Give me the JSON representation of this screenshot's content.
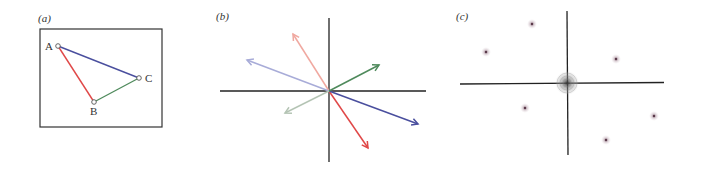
{
  "panels": {
    "a": {
      "label": "(a)",
      "box": {
        "x": 40,
        "y": 29,
        "w": 122,
        "h": 98
      },
      "nodes": [
        {
          "id": "A",
          "label": "A",
          "x": 58,
          "y": 46
        },
        {
          "id": "B",
          "label": "B",
          "x": 94,
          "y": 102
        },
        {
          "id": "C",
          "label": "C",
          "x": 139,
          "y": 78
        }
      ],
      "edges": [
        {
          "from": "A",
          "to": "B",
          "color": "#e04848"
        },
        {
          "from": "B",
          "to": "C",
          "color": "#4f8a5c"
        },
        {
          "from": "A",
          "to": "C",
          "color": "#4a4f9e"
        }
      ]
    },
    "b": {
      "label": "(b)",
      "origin": {
        "x": 329,
        "y": 91
      },
      "axes": {
        "x_from": 220,
        "x_to": 426,
        "y_from": 18,
        "y_to": 162
      },
      "vectors": [
        {
          "name": "red-vector",
          "tip": [
            368,
            148
          ],
          "color": "#e04848"
        },
        {
          "name": "light-red-vector",
          "tip": [
            293,
            34
          ],
          "color": "#f0a8a0"
        },
        {
          "name": "blue-vector",
          "tip": [
            418,
            124
          ],
          "color": "#4a4f9e"
        },
        {
          "name": "light-blue-vector",
          "tip": [
            247,
            60
          ],
          "color": "#a8acd8"
        },
        {
          "name": "green-vector",
          "tip": [
            379,
            65
          ],
          "color": "#4f8a5c"
        },
        {
          "name": "light-green-vector",
          "tip": [
            285,
            113
          ],
          "color": "#b4c4b4"
        }
      ]
    },
    "c": {
      "label": "(c)",
      "origin": {
        "x": 567,
        "y": 83
      },
      "axes": {
        "x_from": 460,
        "x_to": 664,
        "y_from": 11,
        "y_to": 155
      },
      "center_blob_radius": 12,
      "points": [
        {
          "x": 532,
          "y": 24
        },
        {
          "x": 486,
          "y": 52
        },
        {
          "x": 616,
          "y": 59
        },
        {
          "x": 525,
          "y": 108
        },
        {
          "x": 654,
          "y": 116
        },
        {
          "x": 606,
          "y": 140
        }
      ]
    }
  }
}
